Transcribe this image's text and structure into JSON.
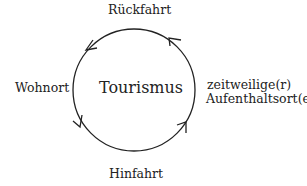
{
  "diagram": {
    "type": "cycle",
    "center_label": "Tourismus",
    "nodes": {
      "top": "Rückfahrt",
      "left": "Wohnort",
      "right_line1": "zeitweilige(r)",
      "right_line2": "Aufenthaltsort(e)",
      "bottom": "Hinfahrt"
    },
    "arrows": [
      {
        "position": "upper-left",
        "direction": "counter-clockwise"
      },
      {
        "position": "lower-left",
        "direction": "counter-clockwise"
      },
      {
        "position": "lower-right",
        "direction": "counter-clockwise"
      },
      {
        "position": "upper-right",
        "direction": "counter-clockwise"
      }
    ],
    "stroke_color": "#222222"
  }
}
